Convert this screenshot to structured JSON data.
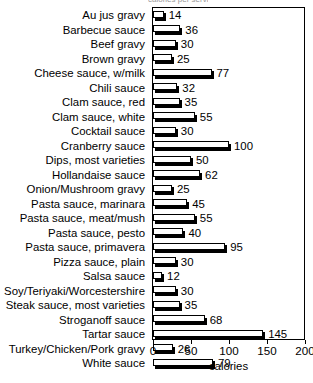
{
  "chart_data": {
    "type": "bar",
    "orientation": "horizontal",
    "title": "",
    "xlabel": "calories",
    "ylabel": "",
    "xlim": [
      0,
      200
    ],
    "xticks": [
      0,
      50,
      100,
      150,
      200
    ],
    "xtick_labels": [
      "0",
      "50",
      "100",
      "150",
      "200"
    ],
    "grid": false,
    "legend": null,
    "bar_style": "white fill, black outline, black 3D drop shadow",
    "value_labels": true,
    "categories": [
      "Au jus gravy",
      "Barbecue sauce",
      "Beef gravy",
      "Brown gravy",
      "Cheese sauce, w/milk",
      "Chili sauce",
      "Clam sauce, red",
      "Clam sauce, white",
      "Cocktail sauce",
      "Cranberry sauce",
      "Dips, most varieties",
      "Hollandaise sauce",
      "Onion/Mushroom gravy",
      "Pasta sauce, marinara",
      "Pasta sauce, meat/mush",
      "Pasta sauce, pesto",
      "Pasta sauce, primavera",
      "Pizza sauce, plain",
      "Salsa sauce",
      "Soy/Teriyaki/Worcestershire",
      "Steak sauce, most varieties",
      "Stroganoff sauce",
      "Tartar sauce",
      "Turkey/Chicken/Pork gravy",
      "White sauce"
    ],
    "values": [
      14,
      36,
      30,
      25,
      77,
      32,
      35,
      55,
      30,
      100,
      50,
      62,
      25,
      45,
      55,
      40,
      95,
      30,
      12,
      30,
      35,
      68,
      145,
      26,
      79
    ],
    "value_label_texts": [
      "14",
      "36",
      "30",
      "25",
      "77",
      "32",
      "35",
      "55",
      "30",
      "100",
      "50",
      "62",
      "25",
      "45",
      "55",
      "40",
      "95",
      "30",
      "12",
      "30",
      "35",
      "68",
      "145",
      "26",
      "79"
    ]
  },
  "artifact": {
    "top_cutoff_text": "calories per serving"
  }
}
